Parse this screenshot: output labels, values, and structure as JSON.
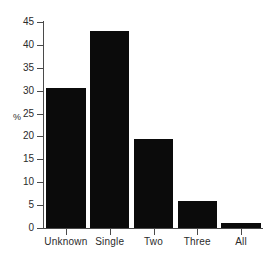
{
  "chart_data": {
    "type": "bar",
    "title": "",
    "subtitle": "",
    "xlabel": "",
    "ylabel": "%",
    "categories": [
      "Unknown",
      "Single",
      "Two",
      "Three",
      "All"
    ],
    "values": [
      30.5,
      43.0,
      19.5,
      6.0,
      1.0
    ],
    "ylim": [
      0,
      45
    ],
    "yticks": [
      0,
      5,
      10,
      15,
      20,
      25,
      30,
      35,
      40,
      45
    ],
    "ytick_labels": [
      "0",
      "5",
      "10",
      "15",
      "20",
      "25",
      "30",
      "35",
      "40",
      "45"
    ],
    "grid": false,
    "legend": null,
    "bar_color": "#0b0b0b",
    "axis_color": "#4a4a4a",
    "text_color": "#2b2b2b",
    "background": "#ffffff",
    "annotations": []
  }
}
